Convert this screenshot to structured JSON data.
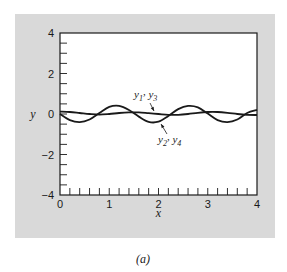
{
  "figure": {
    "panel_color": "#d9d9d9",
    "plot_bg": "#ffffff",
    "line_color": "#1a1a1a",
    "caption": "(a)"
  },
  "chart_data": {
    "type": "line",
    "title": "",
    "xlabel": "x",
    "ylabel": "y",
    "xlim": [
      0,
      4
    ],
    "ylim": [
      -4,
      4
    ],
    "xticks": [
      0,
      1,
      2,
      3,
      4
    ],
    "yticks": [
      -4,
      -2,
      0,
      2,
      4
    ],
    "x_minor_step": 0.2,
    "y_minor_step": 0.5,
    "grid": false,
    "legend": null,
    "series": [
      {
        "name": "y1, y3",
        "x": [
          0,
          0.2,
          0.4,
          0.6,
          0.8,
          1.0,
          1.2,
          1.4,
          1.6,
          1.8,
          2.0,
          2.2,
          2.4,
          2.6,
          2.8,
          3.0,
          3.2,
          3.4,
          3.6,
          3.8,
          4.0
        ],
        "values": [
          0.12,
          0.1,
          0.05,
          0.0,
          -0.03,
          0.0,
          0.05,
          0.08,
          0.08,
          0.04,
          0.0,
          -0.04,
          -0.04,
          0.0,
          0.06,
          0.1,
          0.1,
          0.06,
          0.0,
          -0.04,
          -0.05
        ]
      },
      {
        "name": "y2, y4",
        "x": [
          0,
          0.2,
          0.4,
          0.6,
          0.8,
          1.0,
          1.2,
          1.4,
          1.6,
          1.8,
          2.0,
          2.2,
          2.4,
          2.6,
          2.8,
          3.0,
          3.2,
          3.4,
          3.6,
          3.8,
          4.0
        ],
        "values": [
          0.0,
          -0.3,
          -0.4,
          -0.27,
          0.05,
          0.35,
          0.4,
          0.2,
          -0.13,
          -0.39,
          -0.38,
          -0.1,
          0.24,
          0.4,
          0.33,
          0.02,
          -0.3,
          -0.4,
          -0.27,
          0.05,
          0.2
        ]
      }
    ],
    "annotations": [
      {
        "label": "y1, y3",
        "text_main": "y",
        "sub1": "1",
        "sep": ", ",
        "text_main2": "y",
        "sub2": "3",
        "arrow_to": [
          1.4,
          0.08
        ]
      },
      {
        "label": "y2, y4",
        "text_main": "y",
        "sub1": "2",
        "sep": ", ",
        "text_main2": "y",
        "sub2": "4",
        "arrow_to": [
          1.99,
          -0.4
        ]
      }
    ]
  }
}
